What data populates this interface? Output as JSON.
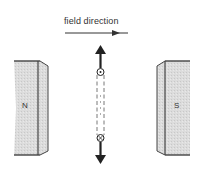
{
  "diagram": {
    "field_label": "field direction",
    "magnets": [
      {
        "pole": "N",
        "side": "left"
      },
      {
        "pole": "S",
        "side": "right"
      }
    ],
    "conductor": {
      "top_marker": "current-out-of-page (dot)",
      "bottom_marker": "current-into-page (cross)",
      "motion_arrows": [
        "up",
        "down"
      ]
    },
    "colors": {
      "magnet_fill": "#d9d9d9",
      "line": "#333333"
    }
  }
}
